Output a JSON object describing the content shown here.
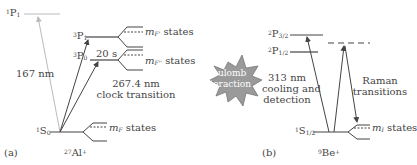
{
  "panel_a": {
    "tag": "(a)",
    "ion": {
      "sup": "27",
      "base": "Al",
      "charge": "+"
    },
    "levels": {
      "p1_singlet": {
        "sup": "1",
        "base": "P",
        "sub": "1"
      },
      "p1_triplet": {
        "sup": "3",
        "base": "P",
        "sub": "1"
      },
      "p0_triplet": {
        "sup": "3",
        "base": "P",
        "sub": "0"
      },
      "s0_ground": {
        "sup": "1",
        "base": "S",
        "sub": "0"
      }
    },
    "lifetime": "20 s",
    "mf_label_top": {
      "m": "m",
      "sub": "F'",
      "text": " states"
    },
    "mf_label_mid": {
      "m": "m",
      "sub": "F''",
      "text": " states"
    },
    "mf_label_ground": {
      "m": "m",
      "sub": "F",
      "text": " states"
    },
    "transition_167": "167 nm",
    "clock_line1": "267.4 nm",
    "clock_line2": "clock transition"
  },
  "center": {
    "line1": "Coulomb",
    "line2": "interaction"
  },
  "panel_b": {
    "tag": "(b)",
    "ion": {
      "sup": "9",
      "base": "Be",
      "charge": "+"
    },
    "levels": {
      "p32": {
        "sup": "2",
        "base": "P",
        "sub": "3/2"
      },
      "p12": {
        "sup": "2",
        "base": "P",
        "sub": "1/2"
      },
      "s12": {
        "sup": "1",
        "base": "S",
        "sub": "1/2"
      }
    },
    "cooling_line1": "313 nm",
    "cooling_line2": "cooling and",
    "cooling_line3": "detection",
    "raman_line1": "Raman",
    "raman_line2": "transitions",
    "mi_label": {
      "m": "m",
      "sub": "I",
      "text": " states"
    }
  },
  "colors": {
    "line": "#444444",
    "faint": "#bbbbbb",
    "burst": "#9a9a9a"
  }
}
